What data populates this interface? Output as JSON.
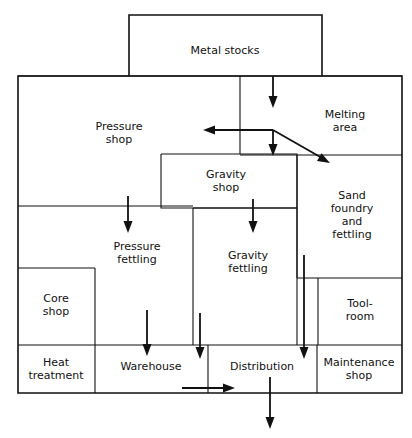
{
  "diagram": {
    "stroke_color": "#111111",
    "background_color": "#ffffff",
    "areas": [
      {
        "id": "metal-stocks",
        "label": "Metal stocks",
        "x": 129,
        "y": 15,
        "w": 193,
        "h": 61,
        "cx": 225,
        "cy": 50
      },
      {
        "id": "pressure-shop",
        "label": "Pressure\nshop",
        "x": 18,
        "y": 76,
        "w": 222,
        "h": 130,
        "cx": 119,
        "cy": 133
      },
      {
        "id": "melting-area",
        "label": "Melting\narea",
        "x": 240,
        "y": 76,
        "w": 162,
        "h": 79,
        "cx": 345,
        "cy": 121
      },
      {
        "id": "gravity-shop",
        "label": "Gravity\nshop",
        "x": 161,
        "y": 154,
        "w": 136,
        "h": 54,
        "cx": 226,
        "cy": 181
      },
      {
        "id": "sand-foundry",
        "label": "Sand\nfoundry\nand\nfettling",
        "x": 297,
        "y": 155,
        "w": 105,
        "h": 123,
        "cx": 352,
        "cy": 215
      },
      {
        "id": "pressure-fettling",
        "label": "Pressure\nfettling",
        "x": 18,
        "y": 206,
        "w": 175,
        "h": 139,
        "cx": 137,
        "cy": 253
      },
      {
        "id": "gravity-fettling",
        "label": "Gravity\nfettling",
        "x": 193,
        "y": 208,
        "w": 104,
        "h": 137,
        "cx": 248,
        "cy": 262
      },
      {
        "id": "core-shop",
        "label": "Core\nshop",
        "x": 18,
        "y": 268,
        "w": 77,
        "h": 77,
        "cx": 56,
        "cy": 305
      },
      {
        "id": "tool-room",
        "label": "Tool-\nroom",
        "x": 318,
        "y": 278,
        "w": 84,
        "h": 67,
        "cx": 360,
        "cy": 310
      },
      {
        "id": "heat-treatment",
        "label": "Heat\ntreatment",
        "x": 18,
        "y": 345,
        "w": 77,
        "h": 48,
        "cx": 56,
        "cy": 369
      },
      {
        "id": "warehouse",
        "label": "Warehouse",
        "x": 95,
        "y": 345,
        "w": 113,
        "h": 48,
        "cx": 151,
        "cy": 366
      },
      {
        "id": "distribution",
        "label": "Distribution",
        "x": 208,
        "y": 345,
        "w": 109,
        "h": 48,
        "cx": 262,
        "cy": 366
      },
      {
        "id": "maintenance-shop",
        "label": "Maintenance\nshop",
        "x": 317,
        "y": 345,
        "w": 85,
        "h": 48,
        "cx": 359,
        "cy": 369
      }
    ],
    "flows": [
      {
        "id": "stocks-to-melting",
        "from": "metal-stocks",
        "to": "melting-area"
      },
      {
        "id": "melting-to-pressure",
        "from": "melting-area",
        "to": "pressure-shop"
      },
      {
        "id": "melting-to-gravity",
        "from": "melting-area",
        "to": "gravity-shop"
      },
      {
        "id": "melting-to-sand",
        "from": "melting-area",
        "to": "sand-foundry"
      },
      {
        "id": "pressure-to-fettling",
        "from": "pressure-shop",
        "to": "pressure-fettling"
      },
      {
        "id": "gravity-to-fettling",
        "from": "gravity-shop",
        "to": "gravity-fettling"
      },
      {
        "id": "pressurefet-to-warehouse",
        "from": "pressure-fettling",
        "to": "warehouse"
      },
      {
        "id": "gravityfet-to-warehouse",
        "from": "gravity-fettling",
        "to": "warehouse"
      },
      {
        "id": "sand-to-distribution",
        "from": "sand-foundry",
        "to": "distribution"
      },
      {
        "id": "warehouse-to-distribution",
        "from": "warehouse",
        "to": "distribution"
      },
      {
        "id": "distribution-out",
        "from": "distribution",
        "to": "despatch"
      }
    ]
  }
}
